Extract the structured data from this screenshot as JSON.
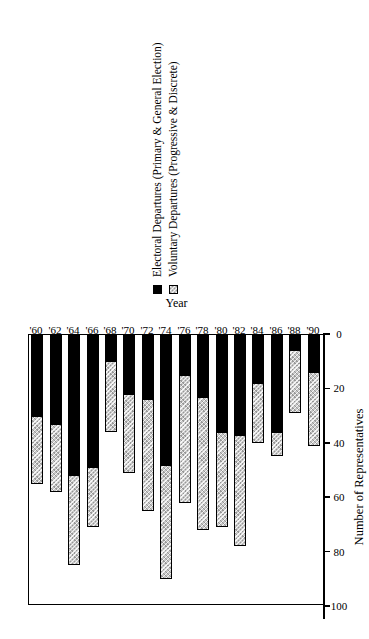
{
  "chart_data": {
    "type": "bar",
    "orientation": "horizontal-stacked",
    "title": "",
    "xlabel": "Number of Representatives",
    "ylabel": "Year",
    "xlim": [
      0,
      100
    ],
    "xticks": [
      0,
      20,
      40,
      60,
      80,
      100
    ],
    "xtick_labels": [
      "0",
      "20",
      "40",
      "60",
      "80",
      "100"
    ],
    "grid": false,
    "legend_position": "bottom-left",
    "categories": [
      "'60",
      "'62",
      "'64",
      "'66",
      "'68",
      "'70",
      "'72",
      "'74",
      "'76",
      "'78",
      "'80",
      "'82",
      "'84",
      "'86",
      "'88",
      "'90"
    ],
    "series": [
      {
        "name": "Electoral Departures (Primary & General Election)",
        "color": "#000000",
        "values": [
          30,
          33,
          52,
          49,
          10,
          22,
          24,
          48,
          15,
          23,
          36,
          37,
          18,
          36,
          6,
          14
        ]
      },
      {
        "name": "Voluntary Departures (Progressive & Discrete)",
        "color": "#c8c8c8",
        "values": [
          25,
          25,
          33,
          22,
          26,
          29,
          41,
          42,
          47,
          49,
          35,
          41,
          22,
          9,
          23,
          27
        ]
      }
    ],
    "totals": [
      55,
      58,
      85,
      71,
      36,
      51,
      65,
      90,
      62,
      72,
      71,
      78,
      40,
      45,
      29,
      41
    ]
  },
  "legend": {
    "items": [
      {
        "label": "Electoral Departures (Primary & General Election)",
        "swatch": "black"
      },
      {
        "label": "Voluntary Departures (Progressive & Discrete)",
        "swatch": "hatch"
      }
    ]
  },
  "axes": {
    "value_axis_title": "Number of Representatives",
    "category_axis_title": "Year"
  }
}
